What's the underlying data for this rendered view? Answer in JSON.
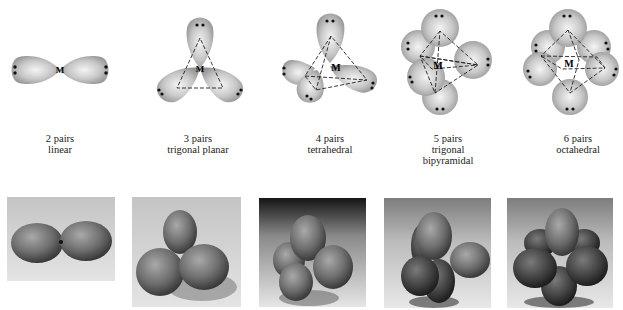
{
  "figure": {
    "geometries": [
      {
        "pairs": "2 pairs",
        "shape": "linear",
        "center_label": "M"
      },
      {
        "pairs": "3 pairs",
        "shape": "trigonal planar",
        "center_label": "M"
      },
      {
        "pairs": "4 pairs",
        "shape": "tetrahedral",
        "center_label": "M"
      },
      {
        "pairs": "5 pairs",
        "shape_line1": "trigonal",
        "shape_line2": "bipyramidal",
        "center_label": "M"
      },
      {
        "pairs": "6 pairs",
        "shape": "octahedral",
        "center_label": "M"
      }
    ],
    "photos": [
      {
        "subject": "balloon-model-linear"
      },
      {
        "subject": "balloon-model-trigonal-planar"
      },
      {
        "subject": "balloon-model-tetrahedral"
      },
      {
        "subject": "balloon-model-trigonal-bipyramidal"
      },
      {
        "subject": "balloon-model-octahedral"
      }
    ],
    "colors": {
      "lobe": "#a8a8a8",
      "lobe_highlight": "#f2f2f2",
      "dots": "#111111"
    }
  }
}
